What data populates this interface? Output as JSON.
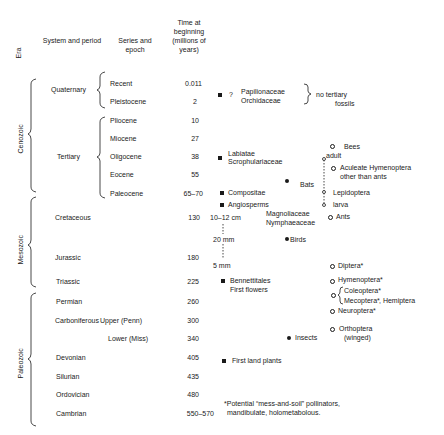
{
  "headers": {
    "era": "Era",
    "system": "System and period",
    "series": "Series and epoch",
    "time": "Time at beginning (millions of years)"
  },
  "eras": [
    {
      "name": "Cenozoic"
    },
    {
      "name": "Mesozoic"
    },
    {
      "name": "Paleozoic"
    }
  ],
  "rows": [
    {
      "system": "Quaternary",
      "series": "Recent",
      "time": "0.011"
    },
    {
      "system": "",
      "series": "Pleistocene",
      "time": "2"
    },
    {
      "system": "",
      "series": "Pliocene",
      "time": "10"
    },
    {
      "system": "",
      "series": "Miocene",
      "time": "27"
    },
    {
      "system": "Tertiary",
      "series": "Oligocene",
      "time": "38"
    },
    {
      "system": "",
      "series": "Eocene",
      "time": "55"
    },
    {
      "system": "",
      "series": "Paleocene",
      "time": "65–70"
    },
    {
      "system": "Cretaceous",
      "series": "",
      "time": "130"
    },
    {
      "system": "Jurassic",
      "series": "",
      "time": "180"
    },
    {
      "system": "Triassic",
      "series": "",
      "time": "225"
    },
    {
      "system": "Permian",
      "series": "",
      "time": "260"
    },
    {
      "system": "Carboniferous",
      "series": "Upper (Penn)",
      "time": "300"
    },
    {
      "system": "",
      "series": "Lower (Miss)",
      "time": "340"
    },
    {
      "system": "Devonian",
      "series": "",
      "time": "405"
    },
    {
      "system": "Silurian",
      "series": "",
      "time": "435"
    },
    {
      "system": "Ordovician",
      "series": "",
      "time": "480"
    },
    {
      "system": "Cambrian",
      "series": "",
      "time": "550–570"
    }
  ],
  "plants": {
    "q": "?",
    "papilionaceae": "Papilionaceae",
    "orchidaceae": "Orchidaceae",
    "no_tertiary_1": "no tertiary",
    "no_tertiary_2": "fossils",
    "labiatae": "Labiatae",
    "scrophulariaceae": "Scrophulariaceae",
    "compositae": "Compositae",
    "angiosperms": "Angiosperms",
    "size_1": "10–12 cm",
    "size_2": "20 mm",
    "size_3": "5 mm",
    "magnoliaceae": "Magnoliaceae",
    "nymphaeaceae": "Nymphaeaceae",
    "bennettitales": "Bennettitales",
    "first_flowers": "First flowers",
    "first_land_plants": "First land plants"
  },
  "animals": {
    "bats": "Bats",
    "birds": "Birds",
    "insects": "Insects"
  },
  "insects": {
    "bees": "Bees",
    "adult": "adult",
    "aculeate_1": "Aculeate Hymenoptera",
    "aculeate_2": "other than ants",
    "lepidoptera": "Lepidoptera",
    "larva": "larva",
    "ants": "Ants",
    "diptera": "Diptera*",
    "hymenoptera": "Hymenoptera*",
    "coleoptera": "Coleoptera*",
    "mecoptera": "Mecoptera*",
    "hemiptera": ", Hemiptera",
    "neuroptera": "Neuroptera*",
    "orthoptera_1": "Orthoptera",
    "orthoptera_2": "(winged)"
  },
  "footnote": {
    "line1": "*Potential “mess-and-soil” pollinators,",
    "line2": "mandibulate, holometabolous."
  }
}
